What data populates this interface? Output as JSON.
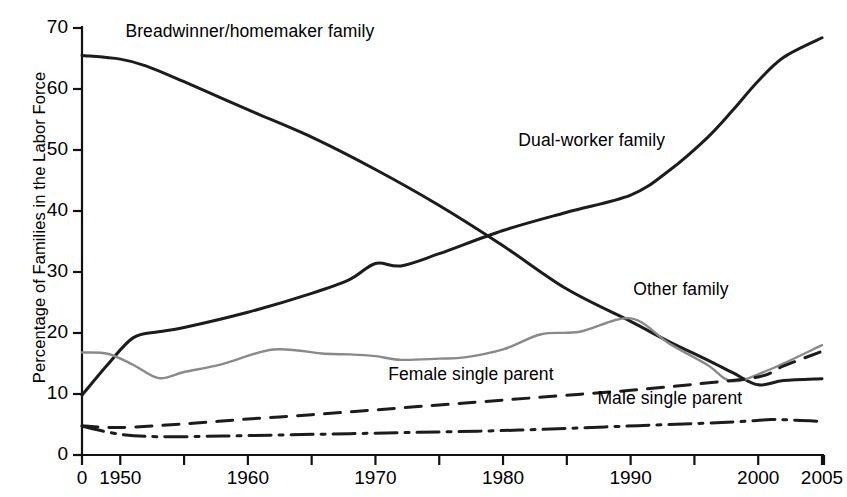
{
  "chart_data": {
    "type": "line",
    "title": "",
    "xlabel": "",
    "ylabel": "Percentage of Families in the Labor Force",
    "xlim": [
      1947,
      2005
    ],
    "ylim": [
      0,
      70
    ],
    "grid": false,
    "legend": "inline-annotations",
    "x_tick_labels": [
      "0",
      "1950",
      "1960",
      "1970",
      "1980",
      "1990",
      "2000",
      "2005"
    ],
    "x_tick_values": [
      1947,
      1950,
      1960,
      1970,
      1980,
      1990,
      2000,
      2005
    ],
    "x_minor_tick_values": [
      1955,
      1965,
      1975,
      1985,
      1995
    ],
    "y_tick_labels": [
      "0",
      "10",
      "20",
      "30",
      "40",
      "50",
      "60",
      "70"
    ],
    "y_tick_values": [
      0,
      10,
      20,
      30,
      40,
      50,
      60,
      70
    ],
    "series": [
      {
        "name": "Breadwinner/homemaker family",
        "style": "solid",
        "color": "#1c1c1c",
        "width": 3.0,
        "label_x": 1950.4,
        "label_y": 69.3,
        "x": [
          1947,
          1950,
          1952,
          1955,
          1960,
          1965,
          1970,
          1975,
          1980,
          1985,
          1990,
          1993,
          1996,
          1998,
          2000,
          2002,
          2005
        ],
        "y": [
          65.5,
          64.9,
          63.8,
          61.2,
          56.6,
          52.1,
          46.8,
          40.9,
          34.3,
          27.2,
          21.9,
          18.6,
          15.6,
          13.5,
          11.5,
          12.2,
          12.5
        ]
      },
      {
        "name": "Dual-worker family",
        "style": "solid",
        "color": "#1c1c1c",
        "width": 3.0,
        "label_x": 1981.2,
        "label_y": 51.5,
        "x": [
          1947,
          1949,
          1951,
          1953,
          1955,
          1960,
          1965,
          1968,
          1970,
          1972,
          1975,
          1980,
          1985,
          1990,
          1993,
          1996,
          1998,
          2000,
          2002,
          2005
        ],
        "y": [
          9.8,
          14.8,
          19.2,
          20.2,
          20.9,
          23.4,
          26.5,
          28.8,
          31.4,
          31.0,
          33.0,
          36.8,
          39.8,
          42.6,
          46.6,
          52.0,
          56.5,
          61.3,
          65.2,
          68.4
        ]
      },
      {
        "name": "Other family",
        "style": "solid",
        "color": "#8a8a8a",
        "width": 2.4,
        "label_x": 1990.2,
        "label_y": 27.0,
        "x": [
          1947,
          1949,
          1951,
          1953,
          1955,
          1958,
          1962,
          1966,
          1968,
          1970,
          1972,
          1975,
          1977,
          1980,
          1983,
          1986,
          1990,
          1993,
          1996,
          1998,
          2001,
          2005
        ],
        "y": [
          16.8,
          16.6,
          14.8,
          12.6,
          13.6,
          14.9,
          17.3,
          16.6,
          16.5,
          16.2,
          15.6,
          15.8,
          16.0,
          17.3,
          19.8,
          20.2,
          22.4,
          18.3,
          14.8,
          12.1,
          14.1,
          18.0
        ]
      },
      {
        "name": "Female single parent",
        "style": "dashed",
        "color": "#1c1c1c",
        "width": 3.0,
        "label_x": 1971.0,
        "label_y": 13.1,
        "x": [
          1947,
          1950,
          1955,
          1960,
          1965,
          1970,
          1975,
          1980,
          1985,
          1990,
          1995,
          2000,
          2002,
          2005
        ],
        "y": [
          4.8,
          4.5,
          5.1,
          5.9,
          6.6,
          7.4,
          8.2,
          9.0,
          9.8,
          10.6,
          11.6,
          12.8,
          14.6,
          17.0
        ]
      },
      {
        "name": "Male single parent",
        "style": "dashdot",
        "color": "#1c1c1c",
        "width": 3.0,
        "label_x": 1987.4,
        "label_y": 9.2,
        "x": [
          1947,
          1950,
          1953,
          1958,
          1963,
          1968,
          1973,
          1978,
          1983,
          1988,
          1993,
          1998,
          2001,
          2003,
          2005
        ],
        "y": [
          4.7,
          3.4,
          3.0,
          3.1,
          3.3,
          3.5,
          3.7,
          3.9,
          4.2,
          4.6,
          5.0,
          5.4,
          5.8,
          5.7,
          5.5
        ]
      }
    ]
  },
  "axes": {
    "y_axis_title": "Percentage of Families in the Labor Force"
  }
}
